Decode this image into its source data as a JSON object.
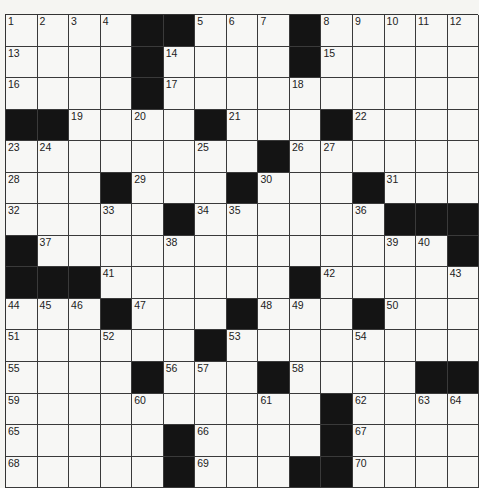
{
  "puzzle": {
    "rows": 15,
    "cols": 15,
    "colors": {
      "background": "#f5f5f2",
      "cell": "#f7f7f5",
      "block": "#141414",
      "grid_line": "#3a3a3a",
      "number": "#222222"
    },
    "grid": [
      [
        "1",
        "2",
        "3",
        "4",
        "#",
        "#",
        "5",
        "6",
        "7",
        "#",
        "8",
        "9",
        "10",
        "11",
        "12"
      ],
      [
        "13",
        "",
        "",
        "",
        "#",
        "14",
        "",
        "",
        "",
        "#",
        "15",
        "",
        "",
        "",
        ""
      ],
      [
        "16",
        "",
        "",
        "",
        "#",
        "17",
        "",
        "",
        "",
        "18",
        "",
        "",
        "",
        "",
        ""
      ],
      [
        "#",
        "#",
        "19",
        "",
        "20",
        "",
        "#",
        "21",
        "",
        "",
        "#",
        "22",
        "",
        "",
        ""
      ],
      [
        "23",
        "24",
        "",
        "",
        "",
        "",
        "25",
        "",
        "#",
        "26",
        "27",
        "",
        "",
        "",
        ""
      ],
      [
        "28",
        "",
        "",
        "#",
        "29",
        "",
        "",
        "#",
        "30",
        "",
        "",
        "#",
        "31",
        "",
        ""
      ],
      [
        "32",
        "",
        "",
        "33",
        "",
        "#",
        "34",
        "35",
        "",
        "",
        "",
        "36",
        "#",
        "#",
        "#"
      ],
      [
        "#",
        "37",
        "",
        "",
        "",
        "38",
        "",
        "",
        "",
        "",
        "",
        "",
        "39",
        "40",
        "#"
      ],
      [
        "#",
        "#",
        "#",
        "41",
        "",
        "",
        "",
        "",
        "",
        "#",
        "42",
        "",
        "",
        "",
        "43"
      ],
      [
        "44",
        "45",
        "46",
        "#",
        "47",
        "",
        "",
        "#",
        "48",
        "49",
        "",
        "#",
        "50",
        "",
        ""
      ],
      [
        "51",
        "",
        "",
        "52",
        "",
        "",
        "#",
        "53",
        "",
        "",
        "",
        "54",
        "",
        "",
        ""
      ],
      [
        "55",
        "",
        "",
        "",
        "#",
        "56",
        "57",
        "",
        "#",
        "58",
        "",
        "",
        "",
        "#",
        "#"
      ],
      [
        "59",
        "",
        "",
        "",
        "60",
        "",
        "",
        "",
        "61",
        "",
        "#",
        "62",
        "",
        "63",
        "64"
      ],
      [
        "65",
        "",
        "",
        "",
        "",
        "#",
        "66",
        "",
        "",
        "",
        "#",
        "67",
        "",
        "",
        ""
      ],
      [
        "68",
        "",
        "",
        "",
        "",
        "#",
        "69",
        "",
        "",
        "#",
        "#",
        "70",
        "",
        "",
        ""
      ]
    ],
    "entries": {}
  }
}
